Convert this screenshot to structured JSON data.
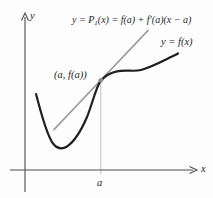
{
  "figure": {
    "tangent_formula": {
      "prefix": "y = P",
      "subscript": "1",
      "suffix": "(x) = f(a) + f′(a)(x − a)"
    },
    "curve_label": "y = f(x)",
    "tangency_point_label": "(a, f(a))",
    "axis_labels": {
      "x": "x",
      "y": "y"
    },
    "x_tick_label": "a"
  },
  "colors": {
    "background": "#fdfdfd",
    "curve": "#1f1f1f",
    "tangent_line": "#9a9a9a",
    "guide_line": "#c5c5c5",
    "axis": "#4d4d4d",
    "point_dot": "#8c8c8c",
    "text": "#1f1f1f"
  }
}
